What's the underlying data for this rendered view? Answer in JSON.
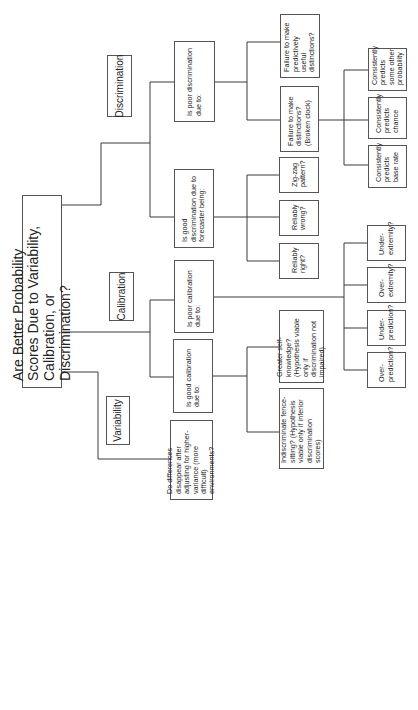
{
  "title": "Are Better Probability Scores Due to Variability, Calibration, or Discrimination?",
  "categories": {
    "variability": "Variability",
    "calibration": "Calibration",
    "discrimination": "Discrimination"
  },
  "level2": {
    "variability_question": "Do differences disappear after adjusting for higher-variance (more difficult) environments?",
    "good_calibration": "Is good calibration due to:",
    "poor_calibration": "Is poor calibration due to:",
    "good_discrimination": "Is good discrimination due to forecaster being:",
    "poor_discrimination": "Is poor discrimination due to:"
  },
  "level3": {
    "fence_sitting": "Indiscriminate fence-sitting? (Hypothesis viable only if inferior discrimination scores)",
    "self_knowledge": "Greater self-knowledge? (Hypothesis viable only if discrimination not impaired)",
    "reliably_right": "Reliably right?",
    "reliably_wrong": "Reliably wrong?",
    "zig_zag": "Zig-zag pattern?",
    "broken_clock": "Failure to make distinctions? (Broken clock)",
    "predictively_useful": "Failure to make predictively useful distinctions?"
  },
  "level4": {
    "over_prediction": "Over-prediction?",
    "under_prediction": "Under-prediction?",
    "over_extremity": "Over-extremity?",
    "under_extremity": "Under-extremity?",
    "base_rate": "Consistently predicts base rate",
    "chance": "Consistently predicts chance",
    "other_probability": "Consistently predicts some other probability"
  },
  "colors": {
    "background": "#ffffff",
    "line": "#3a3a3a",
    "border": "#555555",
    "text": "#222222"
  }
}
